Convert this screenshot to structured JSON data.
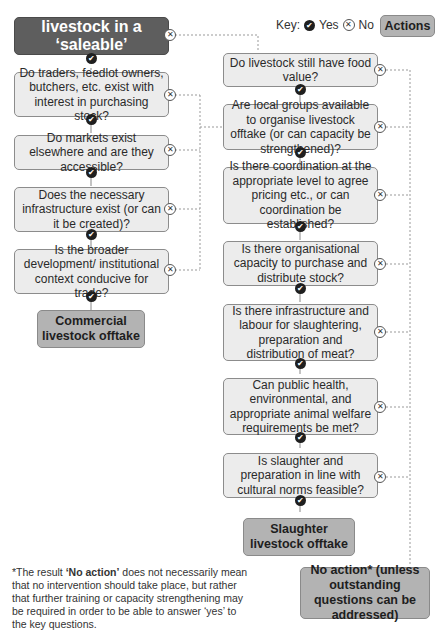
{
  "key": {
    "label": "Key:",
    "yes_label": "Yes",
    "no_label": "No",
    "actions_label": "Actions"
  },
  "start": {
    "text": "Are some livestock in a ‘saleable’ condition?"
  },
  "left_questions": [
    {
      "text": "Do traders, feedlot owners, butchers, etc. exist with interest in purchasing stock?"
    },
    {
      "text": "Do markets exist elsewhere and are they accessible?"
    },
    {
      "text": "Does the necessary infrastructure exist (or can it be created)?"
    },
    {
      "text": "Is the broader development/ institutional context conducive for trade?"
    }
  ],
  "left_outcome": {
    "text": "Commercial livestock offtake"
  },
  "right_questions": [
    {
      "text": "Do livestock still have food value?"
    },
    {
      "text": "Are local groups available to organise livestock offtake (or can capacity be strengthened)?"
    },
    {
      "text": "Is there coordination at the appropriate level to agree pricing etc., or can coordination be established?"
    },
    {
      "text": "Is there organisational capacity to purchase and distribute stock?"
    },
    {
      "text": "Is there infrastructure and labour for slaughtering, preparation and distribution of meat?"
    },
    {
      "text": "Can public health, environmental, and appropriate animal welfare requirements be met?"
    },
    {
      "text": "Is slaughter and preparation in line with cultural norms feasible?"
    }
  ],
  "right_outcome": {
    "text": "Slaughter livestock offtake"
  },
  "no_action": {
    "text": "No action* (unless outstanding questions can be addressed)"
  },
  "footnote": {
    "prefix": "*The result ",
    "bold": "‘No action’",
    "suffix": " does not necessarily mean that no intervention should take place, but rather that further training or capacity strengthening may be required in order to be able to answer ‘yes’ to the key questions."
  },
  "icons": {
    "yes": "✔",
    "no": "✕"
  }
}
